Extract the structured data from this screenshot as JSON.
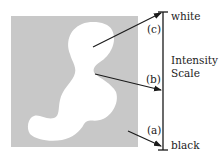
{
  "diagram": {
    "colors": {
      "background_square": "#c8c8c8",
      "blob": "#ffffff",
      "lines": "#1a1a1a"
    },
    "scale": {
      "top_label": "white",
      "bottom_label": "black",
      "title_line1": "Intensity",
      "title_line2": "Scale"
    },
    "pointers": [
      {
        "id": "a",
        "label": "(a)",
        "target": "black end of scale",
        "source": "gray background"
      },
      {
        "id": "b",
        "label": "(b)",
        "target": "middle of scale",
        "source": "blob boundary"
      },
      {
        "id": "c",
        "label": "(c)",
        "target": "white end of scale",
        "source": "white blob interior"
      }
    ]
  }
}
